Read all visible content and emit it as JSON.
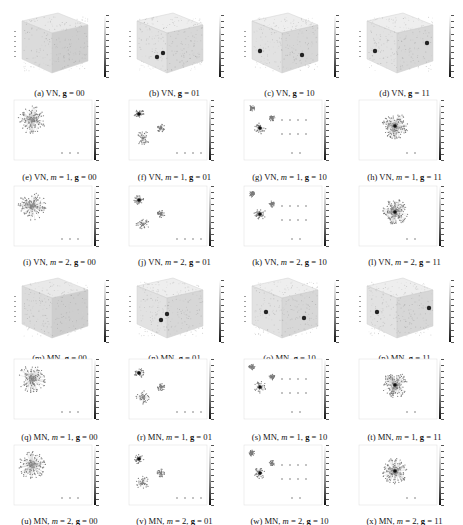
{
  "figure": {
    "rows": 6,
    "cols": 4,
    "panels": [
      {
        "id": "a",
        "net": "VN",
        "m": null,
        "g": "00",
        "type": "cube"
      },
      {
        "id": "b",
        "net": "VN",
        "m": null,
        "g": "01",
        "type": "cube"
      },
      {
        "id": "c",
        "net": "VN",
        "m": null,
        "g": "10",
        "type": "cube"
      },
      {
        "id": "d",
        "net": "VN",
        "m": null,
        "g": "11",
        "type": "cube"
      },
      {
        "id": "e",
        "net": "VN",
        "m": "1",
        "g": "00",
        "type": "graph"
      },
      {
        "id": "f",
        "net": "VN",
        "m": "1",
        "g": "01",
        "type": "graph"
      },
      {
        "id": "g",
        "net": "VN",
        "m": "1",
        "g": "10",
        "type": "graph"
      },
      {
        "id": "h",
        "net": "VN",
        "m": "1",
        "g": "11",
        "type": "graph"
      },
      {
        "id": "i",
        "net": "VN",
        "m": "2",
        "g": "00",
        "type": "graph"
      },
      {
        "id": "j",
        "net": "VN",
        "m": "2",
        "g": "01",
        "type": "graph"
      },
      {
        "id": "k",
        "net": "VN",
        "m": "2",
        "g": "10",
        "type": "graph"
      },
      {
        "id": "l",
        "net": "VN",
        "m": "2",
        "g": "11",
        "type": "graph"
      },
      {
        "id": "m",
        "net": "MN",
        "m": null,
        "g": "00",
        "type": "cube"
      },
      {
        "id": "n",
        "net": "MN",
        "m": null,
        "g": "01",
        "type": "cube"
      },
      {
        "id": "o",
        "net": "MN",
        "m": null,
        "g": "10",
        "type": "cube"
      },
      {
        "id": "p",
        "net": "MN",
        "m": null,
        "g": "11",
        "type": "cube"
      },
      {
        "id": "q",
        "net": "MN",
        "m": "1",
        "g": "00",
        "type": "graph"
      },
      {
        "id": "r",
        "net": "MN",
        "m": "1",
        "g": "01",
        "type": "graph"
      },
      {
        "id": "s",
        "net": "MN",
        "m": "1",
        "g": "10",
        "type": "graph"
      },
      {
        "id": "t",
        "net": "MN",
        "m": "1",
        "g": "11",
        "type": "graph"
      },
      {
        "id": "u",
        "net": "MN",
        "m": "2",
        "g": "00",
        "type": "graph"
      },
      {
        "id": "v",
        "net": "MN",
        "m": "2",
        "g": "01",
        "type": "graph"
      },
      {
        "id": "w",
        "net": "MN",
        "m": "2",
        "g": "10",
        "type": "graph"
      },
      {
        "id": "x",
        "net": "MN",
        "m": "2",
        "g": "11",
        "type": "graph"
      }
    ],
    "captions": [
      "(a) VN, g = 00",
      "(b) VN, g = 01",
      "(c) VN, g = 10",
      "(d) VN, g = 11",
      "(e) VN, m = 1, g = 00",
      "(f) VN, m = 1, g = 01",
      "(g) VN, m = 1, g = 10",
      "(h) VN, m = 1, g = 11",
      "(i) VN, m = 2, g = 00",
      "(j) VN, m = 2, g = 01",
      "(k) VN, m = 2, g = 10",
      "(l) VN, m = 2, g = 11",
      "(m) MN, g = 00",
      "(n) MN, g = 01",
      "(o) MN, g = 10",
      "(p) MN, g = 11",
      "(q) MN, m = 1, g = 00",
      "(r) MN, m = 1, g = 01",
      "(s) MN, m = 1, g = 10",
      "(t) MN, m = 1, g = 11",
      "(u) MN, m = 2, g = 00",
      "(v) MN, m = 2, g = 01",
      "(w) MN, m = 2, g = 10",
      "(x) MN, m = 2, g = 11"
    ],
    "colorbar": {
      "from": "#ffffff",
      "to": "#111111"
    }
  }
}
